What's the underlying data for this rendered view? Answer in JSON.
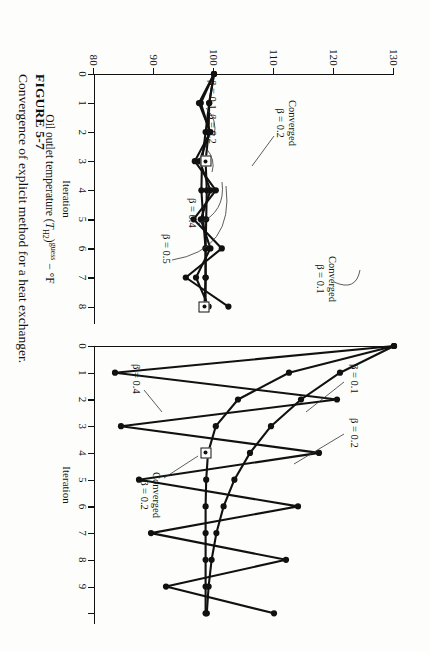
{
  "caption": {
    "figure_number": "FIGURE 5-7",
    "text": "Convergence of explicit method for a heat exchanger."
  },
  "axes": {
    "y_title_main": "Oil outlet temperature (",
    "y_title_sym": "T",
    "y_title_sub": "H2",
    "y_title_close": ")",
    "y_title_sup": "guess",
    "y_title_units": "− °F",
    "y_ticks": [
      "130",
      "120",
      "110",
      "100",
      "90",
      "80"
    ],
    "y_min": 80,
    "y_max": 130,
    "x_title": "Iteration"
  },
  "left_panel": {
    "x_ticks": [
      "0",
      "1",
      "2",
      "3",
      "4",
      "5",
      "6",
      "7",
      "8"
    ],
    "x_min": 0,
    "x_max": 8.6,
    "annotations": [
      {
        "name": "beta-0-1",
        "label": "β = 0.1"
      },
      {
        "name": "beta-0-2",
        "label": "β = 0.2"
      },
      {
        "name": "beta-0-4",
        "label": "β = 0.4"
      },
      {
        "name": "beta-0-5",
        "label": "β = 0.5"
      },
      {
        "name": "converged-0-2",
        "label": "Converged",
        "label2": "β = 0.2"
      },
      {
        "name": "converged-0-1",
        "label": "Converged",
        "label2": "β = 0.1"
      }
    ]
  },
  "right_panel": {
    "x_ticks": [
      "0",
      "1",
      "2",
      "3",
      "4",
      "5",
      "6",
      "7",
      "8",
      "9"
    ],
    "x_min": 0,
    "x_max": 10.4,
    "annotations": [
      {
        "name": "beta-0-1",
        "label": "β = 0.1"
      },
      {
        "name": "beta-0-2",
        "label": "β = 0.2"
      },
      {
        "name": "beta-0-4",
        "label": "β = 0.4"
      },
      {
        "name": "converged-0-2",
        "label": "Converged",
        "label2": "β = 0.2"
      }
    ]
  },
  "chart_data": [
    {
      "id": "left",
      "type": "line",
      "title": "Convergence of explicit method — stable cases",
      "xlabel": "Iteration",
      "ylabel": "Oil outlet temperature (T_H2)^guess − °F",
      "xlim": [
        0,
        8.6
      ],
      "ylim": [
        80,
        130
      ],
      "grid": false,
      "legend": "inline-annotations",
      "markers": "filled-circle",
      "converged_markers": [
        {
          "series": "β = 0.2",
          "x": 3.0,
          "y": 98.6
        },
        {
          "series": "β = 0.1",
          "x": 8.0,
          "y": 98.4
        }
      ],
      "series": [
        {
          "name": "β = 0.1",
          "x": [
            0,
            1,
            2,
            3,
            4,
            5,
            6,
            7,
            8
          ],
          "values": [
            100.0,
            99.2,
            98.6,
            98.0,
            97.9,
            98.2,
            98.6,
            98.6,
            98.4
          ]
        },
        {
          "name": "β = 0.2",
          "x": [
            0,
            1,
            2,
            3,
            4,
            5,
            6,
            7,
            8
          ],
          "values": [
            100.0,
            99.2,
            99.1,
            98.6,
            98.8,
            98.7,
            98.6,
            98.6,
            98.6
          ]
        },
        {
          "name": "β = 0.4",
          "x": [
            0,
            1,
            2,
            3,
            4,
            5,
            6,
            7,
            8
          ],
          "values": [
            100.0,
            97.8,
            99.3,
            97.6,
            99.4,
            97.8,
            99.4,
            97.0,
            99.1
          ]
        },
        {
          "name": "β = 0.5",
          "x": [
            0,
            1,
            2,
            3,
            4,
            5,
            6,
            7,
            8
          ],
          "values": [
            100.0,
            97.5,
            99.4,
            96.8,
            100.3,
            96.6,
            101.3,
            95.3,
            102.4
          ]
        }
      ]
    },
    {
      "id": "right",
      "type": "line",
      "title": "Convergence of explicit method — oscillatory cases",
      "xlabel": "Iteration",
      "ylabel": "Oil outlet temperature (T_H2)^guess − °F",
      "xlim": [
        0,
        10.4
      ],
      "ylim": [
        80,
        130
      ],
      "grid": false,
      "legend": "inline-annotations",
      "markers": "filled-circle",
      "converged_markers": [
        {
          "series": "β = 0.2",
          "x": 4.0,
          "y": 98.6
        }
      ],
      "series": [
        {
          "name": "β = 0.1",
          "x": [
            0,
            1,
            2,
            3,
            4,
            5,
            6,
            7,
            8,
            9,
            10
          ],
          "values": [
            130.0,
            121.0,
            114.5,
            109.5,
            106.0,
            103.4,
            101.6,
            100.4,
            99.6,
            99.1,
            98.8
          ]
        },
        {
          "name": "β = 0.2",
          "x": [
            0,
            1,
            2,
            3,
            4,
            5,
            6,
            7,
            8,
            9,
            10
          ],
          "values": [
            130.0,
            112.5,
            104.0,
            100.3,
            99.0,
            98.7,
            98.6,
            98.6,
            98.6,
            98.6,
            98.6
          ]
        },
        {
          "name": "β = 0.4",
          "x": [
            0,
            1,
            2,
            3,
            4,
            5,
            6,
            7,
            8,
            9,
            10
          ],
          "values": [
            130.0,
            83.5,
            120.5,
            84.5,
            117.5,
            87.5,
            114.0,
            89.5,
            112.0,
            92.0,
            110.0
          ]
        }
      ]
    }
  ]
}
